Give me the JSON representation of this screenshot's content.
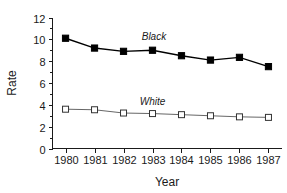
{
  "chart_data": {
    "type": "line",
    "title": "",
    "xlabel": "Year",
    "ylabel": "Rate",
    "categories": [
      "1980",
      "1981",
      "1982",
      "1983",
      "1984",
      "1985",
      "1986",
      "1987"
    ],
    "x": [
      1980,
      1981,
      1982,
      1983,
      1984,
      1985,
      1986,
      1987
    ],
    "series": [
      {
        "name": "Black",
        "marker": "filled-square",
        "color": "#000000",
        "values": [
          10.1,
          9.2,
          8.9,
          9.0,
          8.5,
          8.1,
          8.35,
          7.5
        ]
      },
      {
        "name": "White",
        "marker": "open-square",
        "color": "#555555",
        "values": [
          3.6,
          3.55,
          3.25,
          3.2,
          3.1,
          3.0,
          2.9,
          2.85
        ]
      }
    ],
    "ylim": [
      0,
      12
    ],
    "yticks": [
      0,
      2,
      4,
      6,
      8,
      10,
      12
    ],
    "ytick_labels": [
      "0",
      "2",
      "4",
      "6",
      "8",
      "10",
      "12"
    ],
    "xtick_labels": [
      "1980",
      "1981",
      "1982",
      "1983",
      "1984",
      "1985",
      "1986",
      "1987"
    ],
    "xlim": [
      1979.55,
      1987.45
    ],
    "grid": false,
    "legend": "inline-annotations",
    "annotations": [
      {
        "text": "Black",
        "x": 1983.05,
        "y": 9.95
      },
      {
        "text": "White",
        "x": 1983.0,
        "y": 4.0
      }
    ],
    "minor_ticks_y": true,
    "tick_direction": "out",
    "spines": [
      "left",
      "bottom"
    ]
  }
}
